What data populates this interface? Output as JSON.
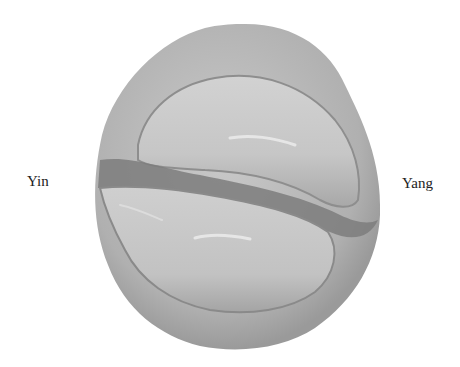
{
  "labels": {
    "left": "Yin",
    "right": "Yang"
  },
  "specimen": {
    "description": "grayscale photograph of a rounded specimen with two interlocking curved lobes",
    "colors": {
      "background": "#ffffff",
      "outer": "#b4b4b4",
      "lobe": "#c8c8c8",
      "shadow": "#7e7e7e",
      "highlight": "#e6e6e6"
    }
  }
}
